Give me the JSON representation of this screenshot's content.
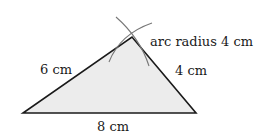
{
  "diagram": {
    "fill_color": "#ececec",
    "line_color": "#1a1a1a",
    "arc_color": "#777777",
    "vertices": {
      "left": [
        23,
        113
      ],
      "right": [
        196,
        113
      ],
      "apex": [
        132,
        37
      ]
    },
    "labels": {
      "left_side": "6 cm",
      "right_side": "4 cm",
      "base": "8 cm",
      "arc_note": "arc radius 4 cm"
    }
  }
}
